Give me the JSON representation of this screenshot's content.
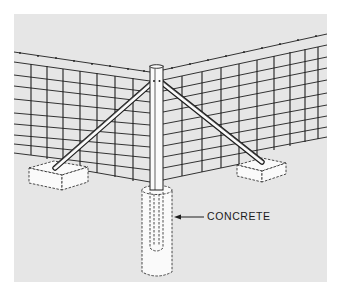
{
  "figure": {
    "background_color": "#e6e6e6",
    "line_color": "#1e1e1e",
    "fill_white": "#fafafa"
  },
  "labels": {
    "concrete": "CONCRETE"
  },
  "components": [
    {
      "name": "corner-post",
      "description": "Vertical tubular corner post"
    },
    {
      "name": "left-brace",
      "description": "Diagonal brace to left footing"
    },
    {
      "name": "right-brace",
      "description": "Diagonal brace to right footing"
    },
    {
      "name": "left-footing",
      "description": "Rectangular concrete block (dashed)"
    },
    {
      "name": "right-footing",
      "description": "Rectangular concrete block (dashed)"
    },
    {
      "name": "post-footing",
      "description": "Cylindrical concrete footing around post base (dashed)"
    },
    {
      "name": "left-fence-panel",
      "description": "Welded wire mesh panel with barbed top wire"
    },
    {
      "name": "right-fence-panel",
      "description": "Welded wire mesh panel with barbed top wire"
    }
  ]
}
